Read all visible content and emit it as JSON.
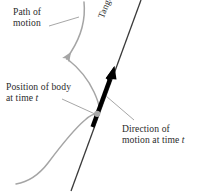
{
  "figure": {
    "width": 203,
    "height": 196,
    "background_color": "#ffffff"
  },
  "labels": {
    "path_of_motion": {
      "line1": "Path of",
      "line2": "motion"
    },
    "position_of_body": {
      "line1": "Position of body",
      "line2_prefix": "at time ",
      "line2_italic": "t"
    },
    "direction_of_motion": {
      "line1": "Direction of",
      "line2_prefix": "motion at time ",
      "line2_italic": "t"
    },
    "tangent": "Tangent"
  },
  "colors": {
    "curve": "#9d9d9d",
    "tangent_line": "#3a3a3a",
    "arrow": "#000000",
    "leader": "#8a8a8a",
    "text": "#2b2b2b",
    "body_dot": "#9d9d9d"
  },
  "geometry": {
    "body_point": {
      "x": 97,
      "y": 114
    },
    "tangent_line": {
      "x1": 141,
      "y1": 0,
      "x2": 71,
      "y2": 191
    },
    "direction_arrow": {
      "x1": 93,
      "y1": 126,
      "x2": 114,
      "y2": 68
    },
    "curve_arrow_tip": {
      "x": 64,
      "y": 61
    }
  }
}
